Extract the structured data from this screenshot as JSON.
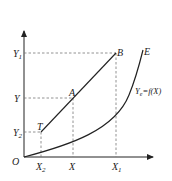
{
  "diagram": {
    "origin_label": "O",
    "y_ticks": [
      {
        "main": "Y",
        "sub": "1"
      },
      {
        "main": "Y",
        "sub": ""
      },
      {
        "main": "Y",
        "sub": "2"
      }
    ],
    "x_ticks": [
      {
        "main": "X",
        "sub": "2"
      },
      {
        "main": "X",
        "sub": ""
      },
      {
        "main": "X",
        "sub": "1"
      }
    ],
    "points": {
      "T": "T",
      "A": "A",
      "B": "B",
      "E": "E"
    },
    "curve_label": {
      "main": "Y",
      "sub": "e",
      "rest": "=f(X)"
    },
    "colors": {
      "line": "#222222",
      "dashed": "#777777"
    }
  }
}
